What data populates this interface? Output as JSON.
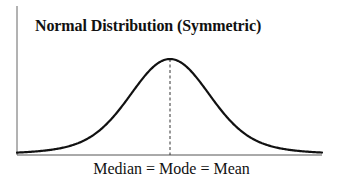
{
  "figure": {
    "title": "Normal Distribution (Symmetric)",
    "xlabel": "Median = Mode = Mean"
  },
  "colors": {
    "curve": "#111111",
    "axis": "#555555",
    "dashed_line": "#333333",
    "background": "#ffffff"
  },
  "chart_data": {
    "type": "line",
    "title": "Normal Distribution (Symmetric)",
    "xlabel": "Median = Mode = Mean",
    "ylabel": "",
    "distribution": "normal",
    "symmetric": true,
    "center_marker": {
      "style": "dashed",
      "label": "Median = Mode = Mean"
    },
    "x": [
      -3,
      -2.5,
      -2,
      -1.5,
      -1,
      -0.5,
      0,
      0.5,
      1,
      1.5,
      2,
      2.5,
      3
    ],
    "values": [
      0.004,
      0.018,
      0.054,
      0.13,
      0.242,
      0.352,
      0.399,
      0.352,
      0.242,
      0.13,
      0.054,
      0.018,
      0.004
    ],
    "ticks": false,
    "grid": false,
    "legend": null
  }
}
